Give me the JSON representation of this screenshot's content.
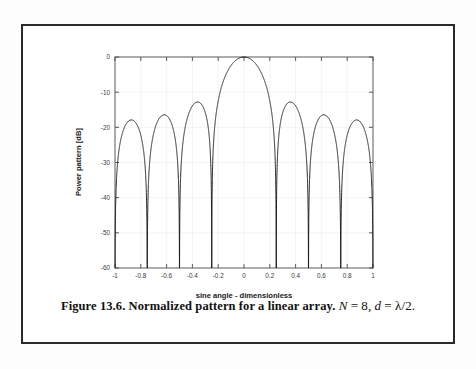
{
  "figure": {
    "caption_prefix": "Figure 13.6. Normalized pattern for a linear array.",
    "caption_var_n": "N",
    "caption_eq1": "=",
    "caption_val_n": "8",
    "caption_comma1": ",",
    "caption_var_d": "d",
    "caption_eq2": "=",
    "caption_val_d": "λ/2",
    "caption_period": "."
  },
  "chart_data": {
    "type": "line",
    "title": "",
    "xlabel": "sine angle - dimensionless",
    "ylabel": "Power pattern [dB]",
    "xlim": [
      -1,
      1
    ],
    "ylim": [
      -60,
      0
    ],
    "xticks": [
      -1,
      -0.8,
      -0.6,
      -0.4,
      -0.2,
      0,
      0.2,
      0.4,
      0.6,
      0.8,
      1
    ],
    "xticklabels": [
      "-1",
      "-0.8",
      "-0.6",
      "-0.4",
      "-0.2",
      "0",
      "0.2",
      "0.4",
      "0.6",
      "0.8",
      "1"
    ],
    "yticks": [
      0,
      -10,
      -20,
      -30,
      -40,
      -50,
      -60
    ],
    "yticklabels": [
      "0",
      "-10",
      "-20",
      "-30",
      "-40",
      "-50",
      "-60"
    ],
    "grid": false,
    "legend": null,
    "series": [
      {
        "name": "Normalized array factor power pattern",
        "color": "#1a1a1a",
        "formula": "20*log10(|sin(N*pi*d*u/lambda)/(N*sin(pi*d*u/lambda))|)",
        "N": 8,
        "d_over_lambda": 0.5,
        "floor_db": -60,
        "main_lobe_peak_db": 0,
        "main_lobe_peak_x": 0,
        "nulls_x": [
          -1.0,
          -0.75,
          -0.5,
          -0.25,
          0.25,
          0.5,
          0.75,
          1.0
        ],
        "sidelobe_peaks": [
          {
            "x": -0.875,
            "y_db": -18.0
          },
          {
            "x": -0.625,
            "y_db": -16.6
          },
          {
            "x": -0.375,
            "y_db": -13.2
          },
          {
            "x": 0.375,
            "y_db": -13.2
          },
          {
            "x": 0.625,
            "y_db": -16.6
          },
          {
            "x": 0.875,
            "y_db": -18.0
          }
        ]
      }
    ]
  }
}
